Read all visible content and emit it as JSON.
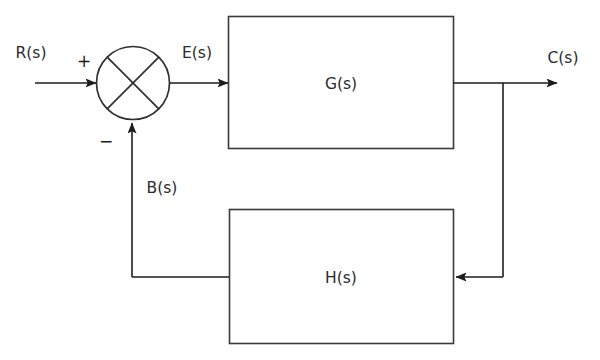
{
  "diagram": {
    "stroke_color": "#3a3a3a",
    "text_color": "#2b2b2b",
    "background_color": "#ffffff",
    "blocks": [
      {
        "id": "forward",
        "label": "G(s)",
        "x": 228,
        "y": 16,
        "width": 225,
        "height": 132
      },
      {
        "id": "feedback",
        "label": "H(s)",
        "x": 229,
        "y": 209,
        "width": 224,
        "height": 134
      }
    ],
    "summing_junction": {
      "name": "summing-junction",
      "cx": 133,
      "cy": 83,
      "r": 36.5,
      "plus_sign": "+",
      "minus_sign": "−",
      "plus_x": 84,
      "plus_y": 62,
      "minus_x": 106,
      "minus_y": 142
    },
    "signals": [
      {
        "id": "input",
        "label": "R(s)",
        "x": 31,
        "y": 53
      },
      {
        "id": "error",
        "label": "E(s)",
        "x": 197,
        "y": 53
      },
      {
        "id": "output",
        "label": "C(s)",
        "x": 563,
        "y": 58
      },
      {
        "id": "feedback",
        "label": "B(s)",
        "x": 162,
        "y": 188
      }
    ],
    "takeoff_point": {
      "name": "takeoff-node",
      "x": 503,
      "y": 83
    }
  }
}
